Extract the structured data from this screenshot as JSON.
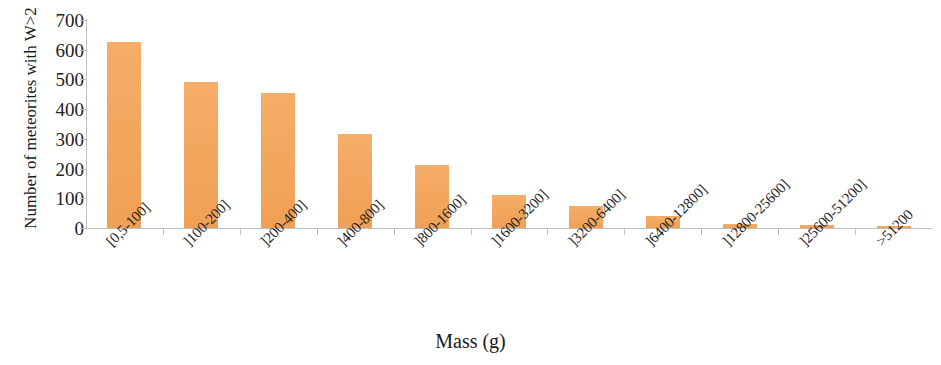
{
  "chart_data": {
    "type": "bar",
    "title": "",
    "xlabel": "Mass (g)",
    "ylabel": "Number of meteorites with W>2",
    "categories": [
      "[0,5-100]",
      "]100-200]",
      "]200-400]",
      "]400-800]",
      "]800-1600]",
      "]1600-3200]",
      "]3200-6400]",
      "]6400-12800]",
      "]12800-25600]",
      "]25600-51200]",
      ">51200"
    ],
    "values": [
      625,
      490,
      455,
      318,
      213,
      110,
      73,
      40,
      13,
      11,
      8
    ],
    "ylim": [
      0,
      700
    ],
    "yticks": [
      0,
      100,
      200,
      300,
      400,
      500,
      600,
      700
    ],
    "ytick_labels": [
      "0",
      "100",
      "200",
      "300",
      "400",
      "500",
      "600",
      "700"
    ],
    "grid": false,
    "legend": null,
    "bar_color": "#f3a65c",
    "axis_color": "#bfbfbf",
    "xlabel_rotation": -45
  }
}
